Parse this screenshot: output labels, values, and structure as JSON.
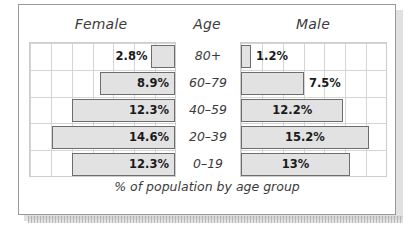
{
  "panel": {
    "headers": {
      "female": "Female",
      "age": "Age",
      "male": "Male"
    },
    "caption": "% of population by age group"
  },
  "chart_data": {
    "type": "bar",
    "subtype": "population-pyramid",
    "title": "",
    "subtitle": "",
    "caption": "% of population by age group",
    "xlabel": "% of population by age group",
    "ylabel": "Age",
    "categories": [
      "80+",
      "60–79",
      "40–59",
      "20–39",
      "0–19"
    ],
    "category_order": "top-to-bottom",
    "grid": true,
    "grid_columns": 7,
    "grid_rows": 5,
    "axis_max_percent": 17.5,
    "legend_position": "top",
    "series": [
      {
        "name": "Female",
        "direction": "left",
        "values": [
          2.8,
          8.9,
          12.3,
          14.6,
          12.3
        ],
        "labels": [
          "2.8%",
          "8.9%",
          "12.3%",
          "14.6%",
          "12.3%"
        ],
        "label_placement": [
          "outside",
          "inside",
          "inside",
          "inside",
          "inside"
        ]
      },
      {
        "name": "Male",
        "direction": "right",
        "values": [
          1.2,
          7.5,
          12.2,
          15.2,
          13.0
        ],
        "labels": [
          "1.2%",
          "7.5%",
          "12.2%",
          "15.2%",
          "13%"
        ],
        "label_placement": [
          "outside",
          "outside",
          "inside",
          "inside",
          "inside"
        ]
      }
    ],
    "colors": {
      "bar_fill": "#e2e2e2",
      "bar_border": "#6d6d6d",
      "gridline": "#d5d5d5",
      "frame": "#9a9a9a",
      "text": "#3b3b3b",
      "value_text": "#1a1a1a",
      "background": "#ffffff"
    }
  }
}
